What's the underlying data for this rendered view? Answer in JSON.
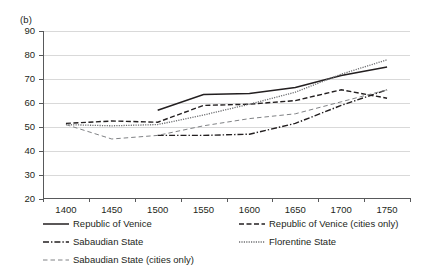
{
  "panel": {
    "label": "(b)"
  },
  "chart_data": {
    "type": "line",
    "title": "",
    "xlabel": "",
    "ylabel": "",
    "categories": [
      1400,
      1450,
      1500,
      1550,
      1600,
      1650,
      1700,
      1750
    ],
    "xtick_labels": [
      "1400",
      "1450",
      "1500",
      "1550",
      "1600",
      "1650",
      "1700",
      "1750"
    ],
    "ylim": [
      20,
      90
    ],
    "ytick_labels": [
      "20",
      "30",
      "40",
      "50",
      "60",
      "70",
      "80",
      "90"
    ],
    "ytick_values": [
      20,
      30,
      40,
      50,
      60,
      70,
      80,
      90
    ],
    "grid": true,
    "legend_position": "below",
    "series": [
      {
        "name": "Republic of Venice",
        "style": "solid",
        "color": "#231f20",
        "x": [
          1500,
          1550,
          1600,
          1650,
          1700,
          1750
        ],
        "values": [
          57.0,
          63.5,
          64.0,
          66.5,
          71.5,
          75.0
        ]
      },
      {
        "name": "Republic of Venice (cities only)",
        "style": "dashed",
        "color": "#231f20",
        "x": [
          1400,
          1450,
          1500,
          1550,
          1600,
          1650,
          1700,
          1750
        ],
        "values": [
          51.5,
          52.5,
          52.0,
          59.0,
          59.5,
          61.0,
          65.5,
          62.0
        ]
      },
      {
        "name": "Sabaudian State",
        "style": "dash-dot",
        "color": "#231f20",
        "x": [
          1500,
          1550,
          1600,
          1650,
          1700,
          1750
        ],
        "values": [
          46.5,
          46.5,
          47.0,
          51.5,
          59.0,
          65.5
        ]
      },
      {
        "name": "Florentine State",
        "style": "dotted",
        "color": "#6d6e71",
        "x": [
          1400,
          1450,
          1500,
          1550,
          1600,
          1650,
          1700,
          1750
        ],
        "values": [
          51.0,
          50.5,
          51.0,
          55.0,
          59.5,
          64.5,
          72.0,
          78.0
        ]
      },
      {
        "name": "Sabaudian State (cities only)",
        "style": "long-dash",
        "color": "#808285",
        "x": [
          1400,
          1450,
          1500,
          1550,
          1600,
          1650,
          1700,
          1750
        ],
        "values": [
          51.0,
          45.0,
          46.5,
          50.5,
          53.5,
          55.5,
          60.5,
          65.5
        ]
      }
    ]
  },
  "legend": {
    "items": [
      {
        "label": "Republic of Venice",
        "style": "solid",
        "col": 0,
        "row": 0
      },
      {
        "label": "Republic of Venice (cities only)",
        "style": "dashed",
        "col": 1,
        "row": 0
      },
      {
        "label": "Sabaudian State",
        "style": "dash-dot",
        "col": 0,
        "row": 1
      },
      {
        "label": "Florentine State",
        "style": "dotted",
        "col": 1,
        "row": 1
      },
      {
        "label": "Sabaudian State (cities only)",
        "style": "long-dash",
        "col": 0,
        "row": 2
      }
    ]
  }
}
